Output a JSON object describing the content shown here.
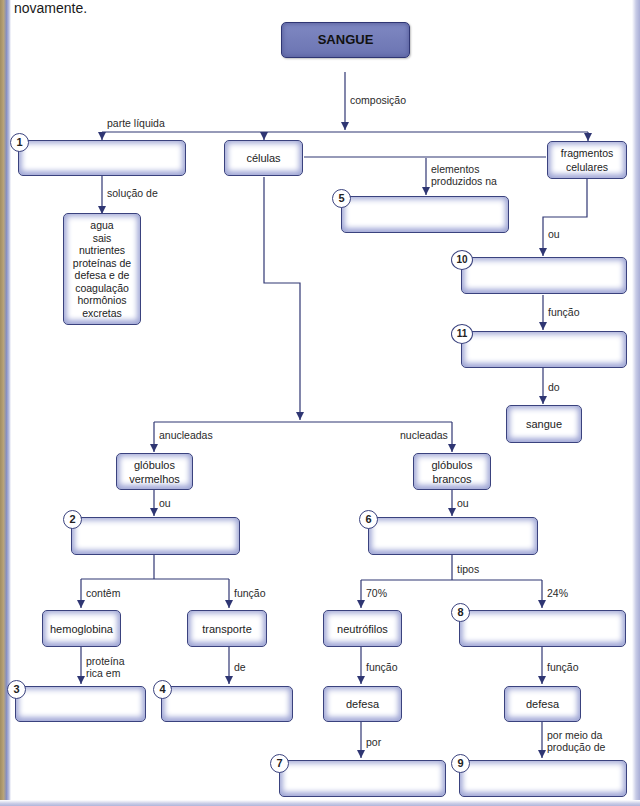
{
  "intro_text": "novamente.",
  "diagram": {
    "title": "SANGUE",
    "colors": {
      "line": "#2f3673",
      "box_border": "#3a427e",
      "main_box_fill": "#7079b7",
      "box_glow": "#9ea5d4"
    },
    "boxes": {
      "sangue": "SANGUE",
      "b1": "",
      "celulas": "células",
      "fragmentos": "fragmentos celulares",
      "plasma_list": [
        "agua",
        "sais",
        "nutrientes",
        "proteínas de",
        "defesa e de",
        "coagulação",
        "hormônios",
        "excretas"
      ],
      "b5": "",
      "b10": "",
      "b11": "",
      "sangue_small": "sangue",
      "globulos_vermelhos": "glóbulos vermelhos",
      "globulos_brancos": "glóbulos brancos",
      "b2": "",
      "b6": "",
      "hemoglobina": "hemoglobina",
      "transporte": "transporte",
      "neutrofilos": "neutrófilos",
      "b8": "",
      "b3": "",
      "b4": "",
      "defesa_left": "defesa",
      "defesa_right": "defesa",
      "b7": "",
      "b9": ""
    },
    "badges": {
      "n1": "1",
      "n2": "2",
      "n3": "3",
      "n4": "4",
      "n5": "5",
      "n6": "6",
      "n7": "7",
      "n8": "8",
      "n9": "9",
      "n10": "10",
      "n11": "11"
    },
    "labels": {
      "composicao": "composição",
      "parte_liquida": "parte líquida",
      "solucao_de": "solução de",
      "elementos_1": "elementos",
      "elementos_2": "produzidos na",
      "ou_frag": "ou",
      "funcao_10": "função",
      "do": "do",
      "anucleadas": "anucleadas",
      "nucleadas": "nucleadas",
      "ou_verm": "ou",
      "ou_branc": "ou",
      "contem": "contêm",
      "funcao_2": "função",
      "tipos": "tipos",
      "pct70": "70%",
      "pct24": "24%",
      "proteina_1": "proteína",
      "proteina_2": "rica em",
      "de": "de",
      "funcao_neut": "função",
      "funcao_8": "função",
      "por": "por",
      "por_meio_1": "por meio da",
      "por_meio_2": "produção de"
    }
  }
}
